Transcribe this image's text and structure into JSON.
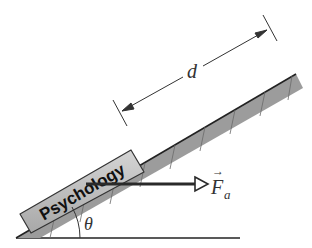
{
  "figure": {
    "block_label": "Psychology",
    "distance_label": "d",
    "force_label": "F",
    "force_subscript": "a",
    "force_vector_arrow": "→",
    "angle_label": "θ"
  },
  "colors": {
    "incline_fill": "#9a9a9a",
    "block_fill": "#b8b8b8",
    "line": "#222222",
    "background": "#ffffff"
  }
}
